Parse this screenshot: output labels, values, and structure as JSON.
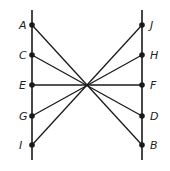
{
  "diagram": {
    "type": "geometry",
    "colors": {
      "line": "#1a1a1a",
      "point": "#1a1a1a",
      "label": "#222222",
      "background": "#ffffff"
    },
    "left_line": {
      "x": 32,
      "y1": 10,
      "y2": 160
    },
    "right_line": {
      "x": 142,
      "y1": 10,
      "y2": 160
    },
    "center": {
      "x": 87,
      "y": 85
    },
    "left_points": [
      {
        "label": "A",
        "y": 25
      },
      {
        "label": "C",
        "y": 55
      },
      {
        "label": "E",
        "y": 85
      },
      {
        "label": "G",
        "y": 116
      },
      {
        "label": "I",
        "y": 145
      }
    ],
    "right_points": [
      {
        "label": "J",
        "y": 25
      },
      {
        "label": "H",
        "y": 55
      },
      {
        "label": "F",
        "y": 85
      },
      {
        "label": "D",
        "y": 116
      },
      {
        "label": "B",
        "y": 145
      }
    ],
    "segments": [
      [
        "A",
        "B"
      ],
      [
        "C",
        "D"
      ],
      [
        "E",
        "F"
      ],
      [
        "G",
        "H"
      ],
      [
        "I",
        "J"
      ]
    ]
  }
}
